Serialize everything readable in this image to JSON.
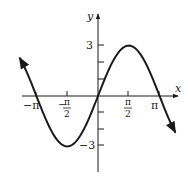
{
  "chart_data": {
    "type": "line",
    "title": "",
    "function": "y = 3 sin(x)",
    "xlabel": "x",
    "ylabel": "y",
    "x_ticks": [
      {
        "value": -3.14159,
        "label": "−π"
      },
      {
        "value": -1.5708,
        "label": "−π/2"
      },
      {
        "value": 1.5708,
        "label": "π/2"
      },
      {
        "value": 3.14159,
        "label": "π"
      }
    ],
    "y_ticks": [
      {
        "value": 3,
        "label": "3"
      },
      {
        "value": 2,
        "label": ""
      },
      {
        "value": 1,
        "label": ""
      },
      {
        "value": -1,
        "label": ""
      },
      {
        "value": -2,
        "label": ""
      },
      {
        "value": -3,
        "label": "−3"
      }
    ],
    "xlim": [
      -3.9,
      3.9
    ],
    "ylim": [
      -4.6,
      4.6
    ],
    "grid": false,
    "legend": null,
    "series": [
      {
        "name": "3 sin x",
        "x": [
          -3.8,
          -3.14159,
          -2.356,
          -1.5708,
          -0.785,
          0,
          0.785,
          1.5708,
          2.356,
          3.14159,
          3.8
        ],
        "values": [
          1.84,
          0,
          -2.12,
          -3,
          -2.12,
          0,
          2.12,
          3,
          2.12,
          0,
          -1.84
        ]
      }
    ],
    "key_points": [
      {
        "x": -3.14159,
        "y": 0
      },
      {
        "x": -1.5708,
        "y": -3
      },
      {
        "x": 0,
        "y": 0
      },
      {
        "x": 1.5708,
        "y": 3
      },
      {
        "x": 3.14159,
        "y": 0
      }
    ]
  },
  "labels": {
    "x_axis": "x",
    "y_axis": "y",
    "y_three": "3",
    "y_neg_three": "−3",
    "neg_pi": "−π",
    "neg_half_minus": "−",
    "pi_sym": "π",
    "two": "2",
    "pi": "π"
  }
}
